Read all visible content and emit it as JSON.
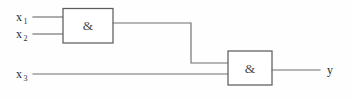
{
  "diagram": {
    "type": "logic-circuit",
    "background_color": "#fefefe",
    "line_color": "#6e6e70",
    "text_color": "#2d2d30",
    "inputs": [
      {
        "id": "x1",
        "base": "x",
        "subscript": "1",
        "label": "x₁"
      },
      {
        "id": "x2",
        "base": "x",
        "subscript": "2",
        "label": "x₂"
      },
      {
        "id": "x3",
        "base": "x",
        "subscript": "3",
        "label": "x₃"
      }
    ],
    "outputs": [
      {
        "id": "y",
        "base": "y",
        "subscript": "",
        "label": "y"
      }
    ],
    "gates": [
      {
        "id": "gate-1",
        "symbol": "&",
        "function": "AND",
        "inputs": [
          "x1",
          "x2"
        ],
        "output": "n1"
      },
      {
        "id": "gate-2",
        "symbol": "&",
        "function": "AND",
        "inputs": [
          "n1",
          "x3"
        ],
        "output": "y"
      }
    ],
    "nets": [
      {
        "id": "x1",
        "from": "input-x1",
        "to": "gate-1.in1"
      },
      {
        "id": "x2",
        "from": "input-x2",
        "to": "gate-1.in2"
      },
      {
        "id": "n1",
        "from": "gate-1.out",
        "to": "gate-2.in1"
      },
      {
        "id": "x3",
        "from": "input-x3",
        "to": "gate-2.in2"
      },
      {
        "id": "y",
        "from": "gate-2.out",
        "to": "output-y"
      }
    ]
  }
}
